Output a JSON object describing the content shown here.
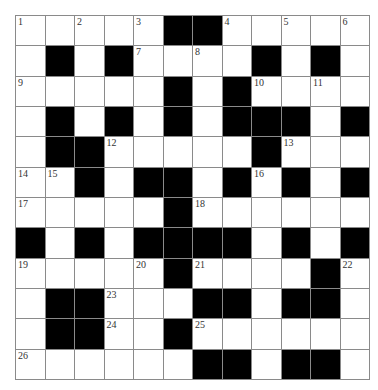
{
  "puzzle": {
    "rows": 12,
    "cols": 12,
    "colors": {
      "block": "#000000",
      "cell": "#ffffff",
      "grid_line": "#8a8a8a",
      "number": "#333333"
    },
    "layout": [
      "WWWWWBBWWWWW",
      "WBWBWWWWBWBW",
      "WWWWWBWBWWWW",
      "WBWBWBWBBBWB",
      "WBBWWWWWBWWW",
      "WWBWBBWBWBWB",
      "WWWWWBWWWWWW",
      "BWBWBBBBWBWB",
      "WWWWWBWWWWBW",
      "WBBWWWBBWBBW",
      "WBBWWBWWWWWW",
      "WWWWWWBBWBBW"
    ],
    "numbers": [
      {
        "row": 0,
        "col": 0,
        "n": "1"
      },
      {
        "row": 0,
        "col": 2,
        "n": "2"
      },
      {
        "row": 0,
        "col": 4,
        "n": "3"
      },
      {
        "row": 0,
        "col": 7,
        "n": "4"
      },
      {
        "row": 0,
        "col": 9,
        "n": "5"
      },
      {
        "row": 0,
        "col": 11,
        "n": "6"
      },
      {
        "row": 1,
        "col": 4,
        "n": "7"
      },
      {
        "row": 1,
        "col": 6,
        "n": "8"
      },
      {
        "row": 2,
        "col": 0,
        "n": "9"
      },
      {
        "row": 2,
        "col": 8,
        "n": "10"
      },
      {
        "row": 2,
        "col": 10,
        "n": "11"
      },
      {
        "row": 4,
        "col": 3,
        "n": "12"
      },
      {
        "row": 4,
        "col": 9,
        "n": "13"
      },
      {
        "row": 5,
        "col": 0,
        "n": "14"
      },
      {
        "row": 5,
        "col": 1,
        "n": "15"
      },
      {
        "row": 5,
        "col": 8,
        "n": "16"
      },
      {
        "row": 6,
        "col": 0,
        "n": "17"
      },
      {
        "row": 6,
        "col": 6,
        "n": "18"
      },
      {
        "row": 8,
        "col": 0,
        "n": "19"
      },
      {
        "row": 8,
        "col": 4,
        "n": "20"
      },
      {
        "row": 8,
        "col": 6,
        "n": "21"
      },
      {
        "row": 8,
        "col": 11,
        "n": "22"
      },
      {
        "row": 9,
        "col": 3,
        "n": "23"
      },
      {
        "row": 10,
        "col": 3,
        "n": "24"
      },
      {
        "row": 10,
        "col": 6,
        "n": "25"
      },
      {
        "row": 11,
        "col": 0,
        "n": "26"
      }
    ],
    "entries": {}
  }
}
